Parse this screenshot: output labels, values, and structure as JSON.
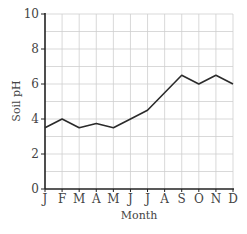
{
  "chart_data": {
    "type": "line",
    "title": "",
    "xlabel": "Month",
    "ylabel": "Soil pH",
    "categories": [
      "J",
      "F",
      "M",
      "A",
      "M",
      "J",
      "J",
      "A",
      "S",
      "O",
      "N",
      "D"
    ],
    "series": [
      {
        "name": "Soil pH",
        "values": [
          3.5,
          4.0,
          3.5,
          3.75,
          3.5,
          4.0,
          4.5,
          5.5,
          6.5,
          6.0,
          6.5,
          6.0
        ]
      }
    ],
    "ylim": [
      0,
      10
    ],
    "yticks": [
      0,
      2,
      4,
      6,
      8,
      10
    ],
    "grid": true,
    "grid_minor_step": 1,
    "legend": "none",
    "colors": {
      "line": "#2b2b2b",
      "grid": "#cfcfcf",
      "axis": "#222222"
    }
  }
}
